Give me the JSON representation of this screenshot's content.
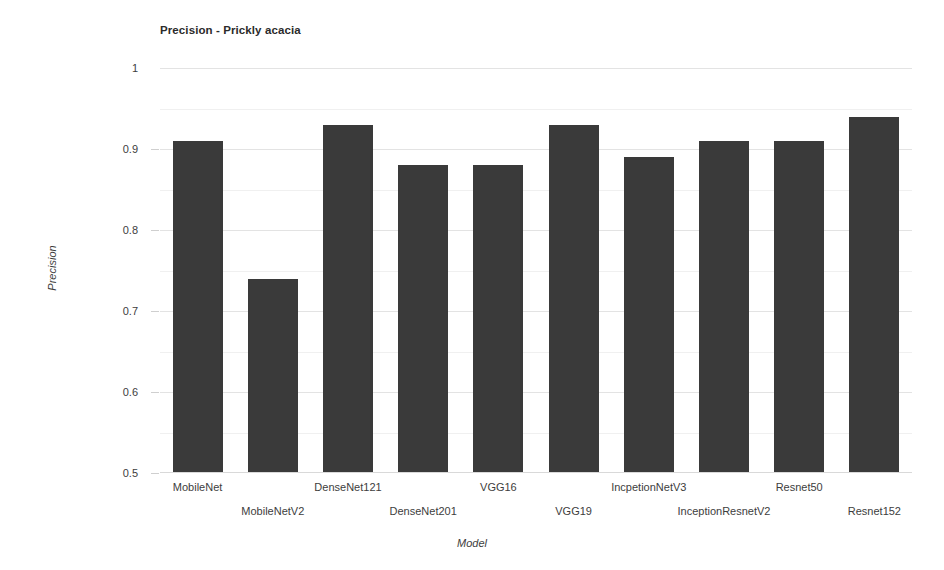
{
  "chart_data": {
    "type": "bar",
    "title": "Precision - Prickly acacia",
    "xlabel": "Model",
    "ylabel": "Precision",
    "categories": [
      "MobileNet",
      "MobileNetV2",
      "DenseNet121",
      "DenseNet201",
      "VGG16",
      "VGG19",
      "IncpetionNetV3",
      "InceptionResnetV2",
      "Resnet50",
      "Resnet152"
    ],
    "values": [
      0.91,
      0.74,
      0.93,
      0.88,
      0.88,
      0.93,
      0.89,
      0.91,
      0.91,
      0.94
    ],
    "ylim": [
      0.5,
      1
    ],
    "ytick_labels": [
      "1",
      "0.9",
      "0.8",
      "0.7",
      "0.6",
      "0.5"
    ],
    "ytick_values": [
      1,
      0.9,
      0.8,
      0.7,
      0.6,
      0.5
    ],
    "minor_ytick_values": [
      0.95,
      0.85,
      0.75,
      0.65,
      0.55
    ],
    "grid": true,
    "legend": "none",
    "bar_color": "#3a3a3a",
    "gridline_color": "#e3e3e3",
    "background_color": "#ffffff"
  }
}
